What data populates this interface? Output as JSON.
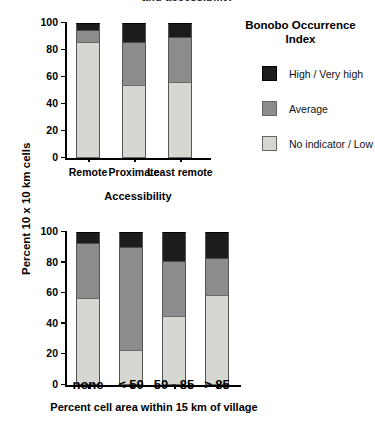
{
  "figure": {
    "clipped_top_title": "and accessibility",
    "background": "#ffffff"
  },
  "legend": {
    "title_line1": "Bonobo Occurrence",
    "title_line2": "Index",
    "position": "right",
    "items": [
      {
        "label": "High / Very high",
        "color": "#1c1c1c",
        "key": "high"
      },
      {
        "label": "Average",
        "color": "#8c8c8c",
        "key": "average"
      },
      {
        "label": "No indicator / Low",
        "color": "#d7d7d2",
        "key": "low"
      }
    ]
  },
  "shared": {
    "ylabel": "Percent 10 x 10 km cells",
    "ylim": [
      0,
      100
    ],
    "yticks": [
      "0",
      "20",
      "40",
      "60",
      "80",
      "100"
    ],
    "ytick_values": [
      0,
      20,
      40,
      60,
      80,
      100
    ]
  },
  "chart_data": [
    {
      "id": "accessibility",
      "type": "bar",
      "stacked": true,
      "title": "",
      "xlabel": "Accessibility",
      "ylabel": "Percent 10 x 10 km cells",
      "ylim": [
        0,
        100
      ],
      "yticks": [
        0,
        20,
        40,
        60,
        80,
        100
      ],
      "grid": false,
      "categories": [
        "Remote",
        "Proximate",
        "Least remote"
      ],
      "series": [
        {
          "name": "No indicator / Low",
          "color": "#d7d7d2",
          "values": [
            86,
            54,
            56
          ]
        },
        {
          "name": "Average",
          "color": "#8c8c8c",
          "values": [
            9,
            32,
            34
          ]
        },
        {
          "name": "High / Very high",
          "color": "#1c1c1c",
          "values": [
            5,
            14,
            10
          ]
        }
      ]
    },
    {
      "id": "village-proximity",
      "type": "bar",
      "stacked": true,
      "title": "",
      "xlabel": "Percent cell area within 15 km of village",
      "ylabel": "Percent 10 x 10 km cells",
      "ylim": [
        0,
        100
      ],
      "yticks": [
        0,
        20,
        40,
        60,
        80,
        100
      ],
      "grid": false,
      "categories": [
        "none",
        "< 50",
        "50 - 85",
        "> 85"
      ],
      "series": [
        {
          "name": "No indicator / Low",
          "color": "#d7d7d2",
          "values": [
            57,
            23,
            45,
            59
          ]
        },
        {
          "name": "Average",
          "color": "#8c8c8c",
          "values": [
            36,
            67,
            36,
            24
          ]
        },
        {
          "name": "High / Very high",
          "color": "#1c1c1c",
          "values": [
            7,
            10,
            19,
            17
          ]
        }
      ]
    }
  ]
}
